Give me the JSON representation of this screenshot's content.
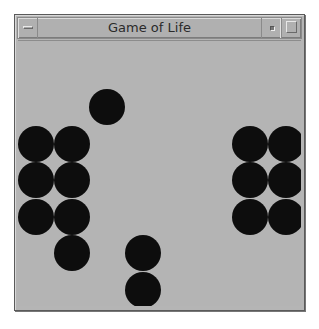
{
  "window": {
    "title": "Game of Life",
    "buttons": [
      {
        "name": "window-menu-button",
        "icon": "window-menu-icon"
      },
      {
        "name": "minimize-button",
        "icon": "minimize-icon"
      },
      {
        "name": "maximize-button",
        "icon": "maximize-icon"
      }
    ]
  },
  "board": {
    "background_color": "#b4b4b4",
    "cell_color": "#0d0d0d",
    "visible_columns": 8,
    "visible_rows": 6,
    "live_cells": [
      {
        "row": 0,
        "col": 2
      },
      {
        "row": 1,
        "col": 0
      },
      {
        "row": 1,
        "col": 1
      },
      {
        "row": 1,
        "col": 6
      },
      {
        "row": 1,
        "col": 7
      },
      {
        "row": 2,
        "col": 0
      },
      {
        "row": 2,
        "col": 1
      },
      {
        "row": 2,
        "col": 6
      },
      {
        "row": 2,
        "col": 7
      },
      {
        "row": 3,
        "col": 0
      },
      {
        "row": 3,
        "col": 1
      },
      {
        "row": 3,
        "col": 6
      },
      {
        "row": 3,
        "col": 7
      },
      {
        "row": 4,
        "col": 1
      },
      {
        "row": 4,
        "col": 3
      },
      {
        "row": 5,
        "col": 3
      }
    ]
  }
}
